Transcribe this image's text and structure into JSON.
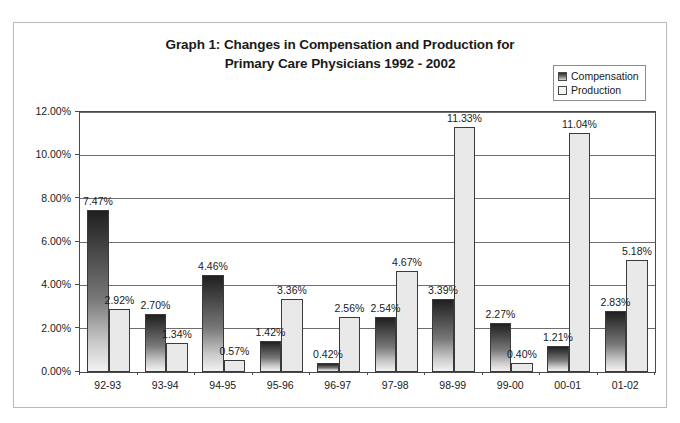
{
  "chart_data": {
    "type": "bar",
    "title": "Graph 1: Changes in Compensation and Production for Primary Care Physicians 1992 - 2002",
    "title_line1": "Graph 1: Changes in Compensation and Production for",
    "title_line2": "Primary Care Physicians 1992 - 2002",
    "xlabel": "",
    "ylabel": "",
    "ylim": [
      0,
      12
    ],
    "ytick_labels": [
      "0.00%",
      "2.00%",
      "4.00%",
      "6.00%",
      "8.00%",
      "10.00%",
      "12.00%"
    ],
    "ytick_values": [
      0,
      2,
      4,
      6,
      8,
      10,
      12
    ],
    "grid": "horizontal",
    "legend_position": "top-right",
    "categories": [
      "92-93",
      "93-94",
      "94-95",
      "95-96",
      "96-97",
      "97-98",
      "98-99",
      "99-00",
      "00-01",
      "01-02"
    ],
    "series": [
      {
        "name": "Compensation",
        "color": "#5a5a5a",
        "values": [
          7.47,
          2.7,
          4.46,
          1.42,
          0.42,
          2.54,
          3.39,
          2.27,
          1.21,
          2.83
        ],
        "labels": [
          "7.47%",
          "2.70%",
          "4.46%",
          "1.42%",
          "0.42%",
          "2.54%",
          "3.39%",
          "2.27%",
          "1.21%",
          "2.83%"
        ]
      },
      {
        "name": "Production",
        "color": "#e9e9e9",
        "values": [
          2.92,
          1.34,
          0.57,
          3.36,
          2.56,
          4.67,
          11.33,
          0.4,
          11.04,
          5.18
        ],
        "labels": [
          "2.92%",
          "1.34%",
          "0.57%",
          "3.36%",
          "2.56%",
          "4.67%",
          "11.33%",
          "0.40%",
          "11.04%",
          "5.18%"
        ]
      }
    ]
  },
  "legend": {
    "items": [
      {
        "label": "Compensation",
        "swatch": "compensation-swatch"
      },
      {
        "label": "Production",
        "swatch": "production-swatch"
      }
    ]
  }
}
